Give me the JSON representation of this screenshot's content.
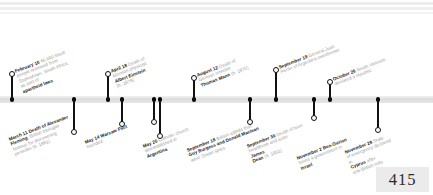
{
  "page": {
    "number": "415",
    "year_context": "1955",
    "axis_color": "#dcdcdc",
    "marker_color": "#111111",
    "label_color": "#9a9a9a",
    "emphasis_color": "#1b1b1b"
  },
  "timeline": {
    "orientation": "horizontal",
    "events_above": [
      {
        "id": "feb-10",
        "date": "February 10",
        "lines": [
          {
            "bold": "February 10",
            "text": " 60,000 black"
          },
          {
            "bold": "",
            "text": "people removed from"
          },
          {
            "bold": "",
            "text": "Sophiatown, South Africa,"
          },
          {
            "bold": "",
            "text": "as part of "
          },
          {
            "bold": "apartheid laws",
            "text": ""
          }
        ],
        "text_full": "February 10 60,000 black people removed from Sophiatown, South Africa, as part of apartheid laws"
      },
      {
        "id": "apr-18",
        "date": "April 18",
        "lines": [
          {
            "bold": "April 18",
            "text": " Death of"
          },
          {
            "bold": "",
            "text": "German physicist"
          },
          {
            "bold": "Albert Einstein",
            "text": ""
          },
          {
            "bold": "",
            "text": "(b. 1879)"
          }
        ],
        "text_full": "April 18 Death of German physicist Albert Einstein (b. 1879)"
      },
      {
        "id": "aug-12",
        "date": "August 12",
        "lines": [
          {
            "bold": "August 12",
            "text": " Death of"
          },
          {
            "bold": "",
            "text": "German novelist"
          },
          {
            "bold": "Thomas Mann",
            "text": " (b. 1875)"
          }
        ],
        "text_full": "August 12 Death of German novelist Thomas Mann (b. 1875)"
      },
      {
        "id": "sep-19",
        "date": "September 19",
        "lines": [
          {
            "bold": "September 19",
            "text": " General Juan"
          },
          {
            "bold": "",
            "text": "Perón of Argentina overthrown"
          }
        ],
        "text_full": "September 19 General Juan Perón of Argentina overthrown"
      },
      {
        "id": "oct-26",
        "date": "October 26",
        "lines": [
          {
            "bold": "October 26",
            "text": " South Vietnam"
          },
          {
            "bold": "",
            "text": "declared a republic"
          }
        ],
        "text_full": "October 26 South Vietnam declared a republic"
      }
    ],
    "events_below": [
      {
        "id": "mar-11",
        "date": "March 11",
        "lines": [
          {
            "bold": "March 11 Death of Alexander",
            "text": ""
          },
          {
            "bold": "Fleming",
            "text": ", British biologist"
          },
          {
            "bold": "",
            "text": "famous for discovering"
          },
          {
            "bold": "",
            "text": "penicillin (b. 1881)"
          }
        ],
        "text_full": "March 11 Death of Alexander Fleming, British biologist famous for discovering penicillin (b. 1881)"
      },
      {
        "id": "may-14",
        "date": "May 14",
        "lines": [
          {
            "bold": "May 14 Warsaw Pact",
            "text": ""
          },
          {
            "bold": "",
            "text": "founded"
          }
        ],
        "text_full": "May 14 Warsaw Pact founded"
      },
      {
        "id": "may-20",
        "date": "May 20",
        "lines": [
          {
            "bold": "May 20",
            "text": " Catholic church"
          },
          {
            "bold": "",
            "text": "disestablished in "
          },
          {
            "bold": "Argentina",
            "text": ""
          }
        ],
        "text_full": "May 20 Catholic church disestablished in Argentina"
      },
      {
        "id": "sep-18",
        "date": "September 18",
        "lines": [
          {
            "bold": "September 18",
            "text": " Britain admits that"
          },
          {
            "bold": "Guy Burgess and Donald Maclean",
            "text": ""
          },
          {
            "bold": "",
            "text": "were Soviet spies"
          }
        ],
        "text_full": "September 18 Britain admits that Guy Burgess and Donald Maclean were Soviet spies"
      },
      {
        "id": "sep-30",
        "date": "September 30",
        "lines": [
          {
            "bold": "September 30",
            "text": " Death of teen"
          },
          {
            "bold": "",
            "text": "heartthrob and actor "
          },
          {
            "bold": "James",
            "text": ""
          },
          {
            "bold": "Dean",
            "text": " (b. 1931)"
          }
        ],
        "text_full": "September 30 Death of teen heartthrob and actor James Dean (b. 1931)"
      },
      {
        "id": "nov-2",
        "date": "November 2",
        "lines": [
          {
            "bold": "November 2 Ben-Gurion",
            "text": ""
          },
          {
            "bold": "",
            "text": "forms a government in "
          },
          {
            "bold": "Israel",
            "text": ""
          }
        ],
        "text_full": "November 2 Ben-Gurion forms a government in Israel"
      },
      {
        "id": "nov-28",
        "date": "November 28",
        "lines": [
          {
            "bold": "November 28",
            "text": " State"
          },
          {
            "bold": "",
            "text": "of emergency declared"
          },
          {
            "bold": "",
            "text": "in "
          },
          {
            "bold": "Cyprus",
            "text": " after"
          },
          {
            "bold": "",
            "text": "anti-British riots"
          }
        ],
        "text_full": "November 28 State of emergency declared in Cyprus after anti-British riots"
      }
    ]
  }
}
